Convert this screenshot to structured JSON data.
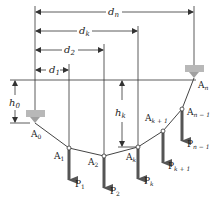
{
  "figure": {
    "colors": {
      "line": "#333333",
      "load_arrow": "#555555",
      "support": "#b0b0b0",
      "node_fill": "#ffffff"
    },
    "dimensions": {
      "d1": "d",
      "d1_sub": "1",
      "d2": "d",
      "d2_sub": "2",
      "dk": "d",
      "dk_sub": "k",
      "dn": "d",
      "dn_sub": "n",
      "h0": "h",
      "h0_sub": "0",
      "hk": "h",
      "hk_sub": "k"
    },
    "points": [
      {
        "id": "A0",
        "base": "A",
        "sub": "0"
      },
      {
        "id": "A1",
        "base": "A",
        "sub": "1"
      },
      {
        "id": "A2",
        "base": "A",
        "sub": "2"
      },
      {
        "id": "Ak",
        "base": "A",
        "sub": "k"
      },
      {
        "id": "Ak+1",
        "base": "A",
        "sub": "k + 1"
      },
      {
        "id": "An-1",
        "base": "A",
        "sub": "n − 1"
      },
      {
        "id": "An",
        "base": "A",
        "sub": "n"
      }
    ],
    "loads": [
      {
        "id": "P1",
        "base": "P",
        "sub": "1"
      },
      {
        "id": "P2",
        "base": "P",
        "sub": "2"
      },
      {
        "id": "Pk",
        "base": "P",
        "sub": "k"
      },
      {
        "id": "Pk+1",
        "base": "P",
        "sub": "k + 1"
      },
      {
        "id": "Pn-1",
        "base": "P",
        "sub": "n − 1"
      }
    ]
  }
}
